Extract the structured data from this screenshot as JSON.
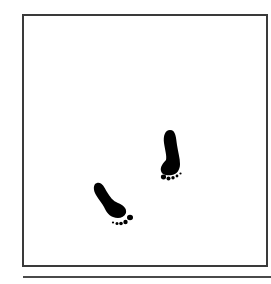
{
  "illustration": {
    "frame": {
      "border_color": "#3a3a3a",
      "background": "#ffffff"
    },
    "rule": {
      "color": "#4a4a4a"
    },
    "footprints": [
      {
        "name": "right-footprint-icon",
        "color": "#000000"
      },
      {
        "name": "left-footprint-icon",
        "color": "#000000"
      }
    ]
  }
}
